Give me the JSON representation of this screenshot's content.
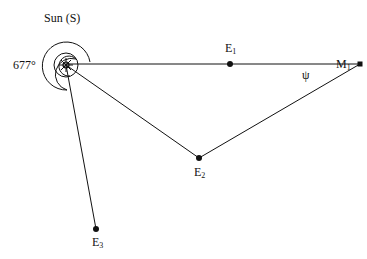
{
  "diagram": {
    "sun_label": "Sun (S)",
    "angle_label": "677°",
    "psi_label": "ψ",
    "points": {
      "sun": {
        "x": 66,
        "y": 65
      },
      "E1": {
        "label": "E",
        "sub": "1",
        "x": 230,
        "y": 64
      },
      "M1": {
        "label": "M",
        "sub": "1",
        "x": 360,
        "y": 64
      },
      "E2": {
        "label": "E",
        "sub": "2",
        "x": 199,
        "y": 158
      },
      "E3": {
        "label": "E",
        "sub": "3",
        "x": 96,
        "y": 229
      }
    },
    "color": "#111111"
  }
}
